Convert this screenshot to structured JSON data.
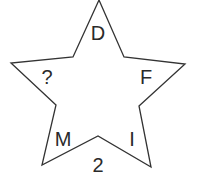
{
  "diagram": {
    "shape": "five-point star",
    "stroke_color": "#333333",
    "fill_color": "#ffffff",
    "labels": {
      "top": "D",
      "upper_left": "?",
      "upper_right": "F",
      "lower_left": "M",
      "lower_right": "I",
      "bottom": "2"
    }
  }
}
